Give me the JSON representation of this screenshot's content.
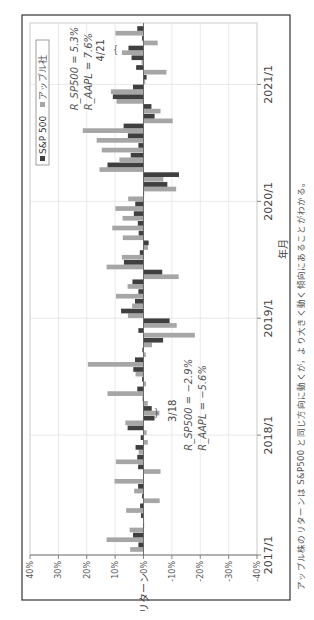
{
  "figure": {
    "caption": "アップル株のリターンは S&P500 と同じ方向に動くが，より大きく動く傾向にあることがわかる。"
  },
  "chart_data": {
    "type": "bar",
    "title": "",
    "xlabel": "年月",
    "ylabel": "リターン",
    "ylim": [
      -40,
      40
    ],
    "yticks": [
      "40%",
      "30%",
      "20%",
      "10%",
      "0%",
      "-10%",
      "-20%",
      "-30%",
      "-40%"
    ],
    "xticks": [
      "2017/1",
      "2018/1",
      "2019/1",
      "2020/1",
      "2021/1"
    ],
    "legend": {
      "position": "upper left",
      "entries": [
        "S&P 500",
        "アップル社"
      ]
    },
    "grid": true,
    "colors": {
      "sp500": "#3f3f3f",
      "aapl": "#a6a6a6",
      "frame": "#333333",
      "grid": "#e3e3e3"
    },
    "categories": [
      "2017/1",
      "2017/2",
      "2017/3",
      "2017/4",
      "2017/5",
      "2017/6",
      "2017/7",
      "2017/8",
      "2017/9",
      "2017/10",
      "2017/11",
      "2017/12",
      "2018/1",
      "2018/2",
      "2018/3",
      "2018/4",
      "2018/5",
      "2018/6",
      "2018/7",
      "2018/8",
      "2018/9",
      "2018/10",
      "2018/11",
      "2018/12",
      "2019/1",
      "2019/2",
      "2019/3",
      "2019/4",
      "2019/5",
      "2019/6",
      "2019/7",
      "2019/8",
      "2019/9",
      "2019/10",
      "2019/11",
      "2019/12",
      "2020/1",
      "2020/2",
      "2020/3",
      "2020/4",
      "2020/5",
      "2020/6",
      "2020/7",
      "2020/8",
      "2020/9",
      "2020/10",
      "2020/11",
      "2020/12",
      "2021/1",
      "2021/2",
      "2021/3",
      "2021/4",
      "2021/5",
      "2021/6"
    ],
    "series": [
      {
        "name": "S&P 500",
        "values": [
          1.8,
          3.7,
          0.0,
          0.9,
          1.2,
          0.5,
          1.9,
          0.1,
          1.9,
          2.2,
          2.8,
          1.0,
          5.6,
          -3.9,
          -2.9,
          0.3,
          2.2,
          0.5,
          3.6,
          3.0,
          0.4,
          -6.9,
          1.8,
          -9.2,
          7.9,
          3.0,
          1.8,
          3.9,
          -6.6,
          6.9,
          1.3,
          -1.8,
          1.7,
          2.0,
          3.4,
          2.9,
          -0.2,
          -8.4,
          -12.5,
          12.7,
          4.5,
          1.8,
          5.5,
          7.0,
          -3.9,
          -2.8,
          10.8,
          3.7,
          -1.1,
          2.6,
          4.2,
          5.3,
          0.5,
          2.2
        ]
      },
      {
        "name": "アップル社",
        "values": [
          4.7,
          13.0,
          4.9,
          0.0,
          6.1,
          -5.7,
          3.3,
          10.2,
          -6.0,
          9.7,
          1.7,
          -1.5,
          -1.1,
          6.4,
          -5.6,
          -1.5,
          12.7,
          -0.9,
          2.8,
          19.6,
          -0.8,
          -3.0,
          -18.1,
          -11.7,
          5.5,
          4.0,
          9.7,
          5.6,
          -12.4,
          13.0,
          7.6,
          -1.6,
          7.3,
          11.0,
          7.4,
          9.9,
          5.4,
          -11.5,
          -7.0,
          15.5,
          8.5,
          14.7,
          16.5,
          21.4,
          -10.3,
          -6.0,
          9.5,
          11.5,
          -0.6,
          -8.1,
          0.7,
          7.6,
          -5.0,
          9.9
        ]
      }
    ],
    "annotations": [
      {
        "label": "3/18",
        "text1": "R_SP500 = −2.9%",
        "text2": "R_AAPL = −5.6%"
      },
      {
        "label": "4/21",
        "text1": "R_SP500 = 5.3%",
        "text2": "R_AAPL = 7.6%"
      }
    ]
  }
}
